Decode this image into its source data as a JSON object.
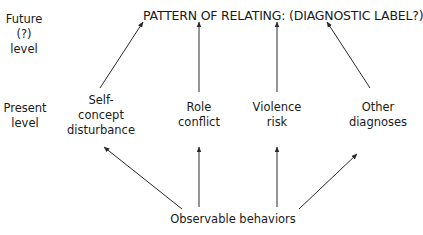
{
  "levels": {
    "future": "Future\n(?)\nlevel",
    "present": "Present\nlevel"
  },
  "title": "PATTERN OF RELATING:  (DIAGNOSTIC LABEL?)",
  "nodes": [
    {
      "id": "self-concept",
      "label": "Self-\nconcept\ndisturbance"
    },
    {
      "id": "role-conflict",
      "label": "Role\nconflict"
    },
    {
      "id": "violence-risk",
      "label": "Violence\nrisk"
    },
    {
      "id": "other-diagnoses",
      "label": "Other\ndiagnoses"
    }
  ],
  "base": "Observable behaviors",
  "colors": {
    "line": "#2a2a2a",
    "text": "#1a1a1a",
    "background": "#ffffff"
  }
}
